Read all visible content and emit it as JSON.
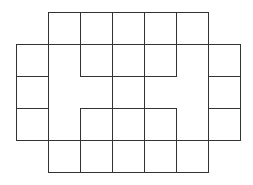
{
  "diagram": {
    "type": "grid-puzzle-figure",
    "width": 253,
    "height": 185,
    "stroke_color": "#333333",
    "background": "#ffffff",
    "cell_size": 32,
    "segments": [
      {
        "id": "top-edge",
        "x1": 48,
        "y1": 12,
        "x2": 208,
        "y2": 12
      },
      {
        "id": "row-44",
        "x1": 16,
        "y1": 44,
        "x2": 240,
        "y2": 44
      },
      {
        "id": "row-76-left",
        "x1": 16,
        "y1": 76,
        "x2": 48,
        "y2": 76
      },
      {
        "id": "row-76-center",
        "x1": 80,
        "y1": 76,
        "x2": 176,
        "y2": 76
      },
      {
        "id": "row-76-right",
        "x1": 208,
        "y1": 76,
        "x2": 240,
        "y2": 76
      },
      {
        "id": "row-108-left",
        "x1": 16,
        "y1": 108,
        "x2": 48,
        "y2": 108
      },
      {
        "id": "row-108-center",
        "x1": 80,
        "y1": 108,
        "x2": 176,
        "y2": 108
      },
      {
        "id": "row-108-right",
        "x1": 208,
        "y1": 108,
        "x2": 240,
        "y2": 108
      },
      {
        "id": "row-140",
        "x1": 16,
        "y1": 140,
        "x2": 240,
        "y2": 140
      },
      {
        "id": "bottom-edge",
        "x1": 48,
        "y1": 172,
        "x2": 208,
        "y2": 172
      },
      {
        "id": "col-16",
        "x1": 16,
        "y1": 44,
        "x2": 16,
        "y2": 140
      },
      {
        "id": "col-48",
        "x1": 48,
        "y1": 12,
        "x2": 48,
        "y2": 172
      },
      {
        "id": "col-80-top",
        "x1": 80,
        "y1": 12,
        "x2": 80,
        "y2": 76
      },
      {
        "id": "col-80-bottom",
        "x1": 80,
        "y1": 108,
        "x2": 80,
        "y2": 172
      },
      {
        "id": "col-112",
        "x1": 112,
        "y1": 12,
        "x2": 112,
        "y2": 172
      },
      {
        "id": "col-144",
        "x1": 144,
        "y1": 12,
        "x2": 144,
        "y2": 172
      },
      {
        "id": "col-176-top",
        "x1": 176,
        "y1": 12,
        "x2": 176,
        "y2": 76
      },
      {
        "id": "col-176-bottom",
        "x1": 176,
        "y1": 108,
        "x2": 176,
        "y2": 172
      },
      {
        "id": "col-208",
        "x1": 208,
        "y1": 12,
        "x2": 208,
        "y2": 172
      },
      {
        "id": "col-240",
        "x1": 240,
        "y1": 44,
        "x2": 240,
        "y2": 140
      }
    ]
  }
}
